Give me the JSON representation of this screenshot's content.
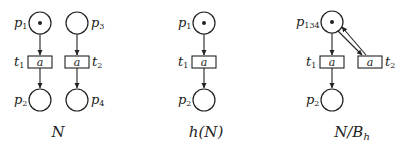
{
  "figure": {
    "panels": [
      {
        "caption": "N",
        "places": [
          {
            "name": "p",
            "sub": "1",
            "tokens": 1
          },
          {
            "name": "p",
            "sub": "3",
            "tokens": 0
          },
          {
            "name": "p",
            "sub": "2",
            "tokens": 0
          },
          {
            "name": "p",
            "sub": "4",
            "tokens": 0
          }
        ],
        "transitions": [
          {
            "name": "t",
            "sub": "1",
            "label": "a"
          },
          {
            "name": "t",
            "sub": "2",
            "label": "a"
          }
        ]
      },
      {
        "caption": "h(N)",
        "places": [
          {
            "name": "p",
            "sub": "1",
            "tokens": 1
          },
          {
            "name": "p",
            "sub": "2",
            "tokens": 0
          }
        ],
        "transitions": [
          {
            "name": "t",
            "sub": "1",
            "label": "a"
          }
        ]
      },
      {
        "caption_main": "N/B",
        "caption_sub": "h",
        "places": [
          {
            "name": "p",
            "sub": "134",
            "tokens": 1
          },
          {
            "name": "p",
            "sub": "2",
            "tokens": 0
          }
        ],
        "transitions": [
          {
            "name": "t",
            "sub": "1",
            "label": "a"
          },
          {
            "name": "t",
            "sub": "2",
            "label": "a"
          }
        ]
      }
    ]
  }
}
